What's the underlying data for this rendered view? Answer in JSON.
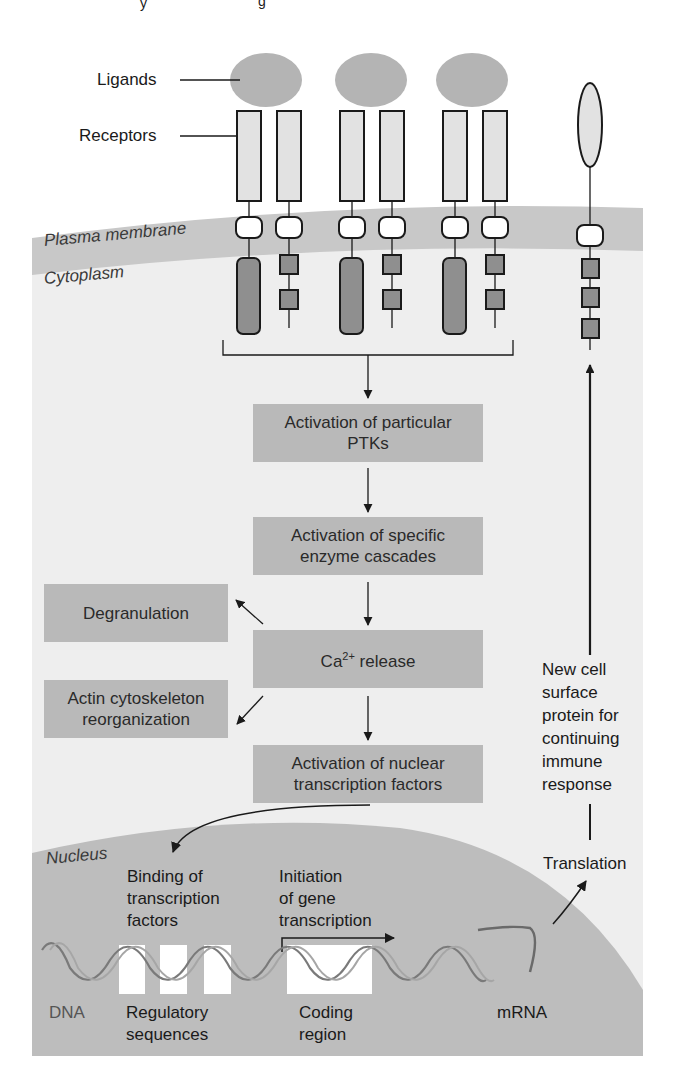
{
  "header": {
    "partial_caption_visible": "…y … …g…"
  },
  "labels": {
    "ligands": "Ligands",
    "receptors": "Receptors",
    "plasma_membrane": "Plasma membrane",
    "cytoplasm": "Cytoplasm",
    "nucleus": "Nucleus"
  },
  "pathway": {
    "step1": {
      "line1": "Activation of particular",
      "line2": "PTKs"
    },
    "step2": {
      "line1": "Activation of specific",
      "line2": "enzyme cascades"
    },
    "step3": {
      "prefix": "Ca",
      "superscript": "2+",
      "suffix": " release"
    },
    "step4": {
      "line1": "Activation of nuclear",
      "line2": "transcription factors"
    }
  },
  "side_effects": {
    "degranulation": "Degranulation",
    "actin": {
      "line1": "Actin cytoskeleton",
      "line2": "reorganization"
    }
  },
  "new_protein": {
    "lines": [
      "New cell",
      "surface",
      "protein for",
      "continuing",
      "immune",
      "response"
    ]
  },
  "nucleus_labels": {
    "binding": {
      "line1": "Binding of",
      "line2": "transcription",
      "line3": "factors"
    },
    "initiation": {
      "line1": "Initiation",
      "line2": "of gene",
      "line3": "transcription"
    },
    "dna": "DNA",
    "regulatory": {
      "line1": "Regulatory",
      "line2": "sequences"
    },
    "coding": {
      "line1": "Coding",
      "line2": "region"
    },
    "mrna": "mRNA",
    "translation": "Translation"
  },
  "colors": {
    "ligand": "#b4b4b4",
    "receptor_fill": "#e2e2e2",
    "membrane": "#c8c8c8",
    "cytoplasm": "#eeeeee",
    "nucleus": "#bdbdbd",
    "box": "#b9b9b9",
    "domain_dark": "#8f8f8f"
  }
}
